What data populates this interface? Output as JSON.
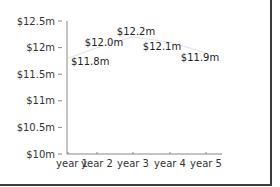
{
  "chart_data": {
    "type": "line",
    "title": "",
    "xlabel": "",
    "ylabel": "",
    "categories": [
      "year 1",
      "year 2",
      "year 3",
      "year 4",
      "year 5"
    ],
    "series": [
      {
        "name": "value",
        "values": [
          11.8,
          12.0,
          12.2,
          12.1,
          11.9
        ],
        "labels": [
          "$11.8m",
          "$12.0m",
          "$12.2m",
          "$12.1m",
          "$11.9m"
        ]
      }
    ],
    "y_ticks": [
      "$10m",
      "$10.5m",
      "$11m",
      "$11.5m",
      "$12m",
      "$12.5m"
    ],
    "ylim": [
      10,
      12.5
    ],
    "grid": false,
    "legend": "none",
    "colors": {
      "line": "#e6e6e6",
      "axis": "#888888",
      "frame": "#3a3a3a"
    }
  }
}
